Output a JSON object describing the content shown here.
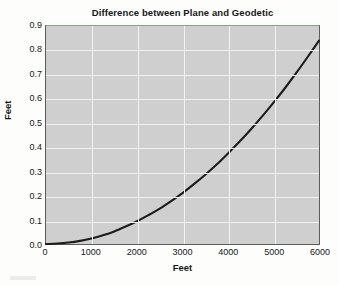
{
  "chart_data": {
    "type": "line",
    "title": "Difference between Plane and Geodetic",
    "xlabel": "Feet",
    "ylabel": "Feet",
    "xlim": [
      0,
      6000
    ],
    "ylim": [
      0.0,
      0.9
    ],
    "grid": true,
    "legend": null,
    "xticks": [
      0,
      1000,
      2000,
      3000,
      4000,
      5000,
      6000
    ],
    "xtick_labels": [
      "0",
      "1000",
      "2000",
      "3000",
      "4000",
      "5000",
      "6000"
    ],
    "yticks": [
      0.0,
      0.1,
      0.2,
      0.3,
      0.4,
      0.5,
      0.6,
      0.7,
      0.8,
      0.9
    ],
    "ytick_labels": [
      "0.0",
      "0.1",
      "0.2",
      "0.3",
      "0.4",
      "0.5",
      "0.6",
      "0.7",
      "0.8",
      "0.9"
    ],
    "series": [
      {
        "name": "Difference",
        "color": "#1c1c1c",
        "x": [
          0,
          250,
          500,
          750,
          1000,
          1250,
          1500,
          1750,
          2000,
          2250,
          2500,
          2750,
          3000,
          3250,
          3500,
          3750,
          4000,
          4250,
          4500,
          4750,
          5000,
          5250,
          5500,
          5750,
          6000
        ],
        "values": [
          0.0,
          0.002,
          0.006,
          0.013,
          0.023,
          0.036,
          0.052,
          0.072,
          0.094,
          0.119,
          0.146,
          0.177,
          0.21,
          0.247,
          0.286,
          0.328,
          0.374,
          0.422,
          0.473,
          0.527,
          0.584,
          0.643,
          0.706,
          0.772,
          0.84
        ]
      }
    ],
    "annotations": []
  },
  "figure": {
    "plot_background": "#cfcfcf",
    "page_background": "#fdfdfb",
    "gridline_color": "#f2f2f0",
    "frame_color": "#5a5d5a",
    "frame_top_color": "#7fa882",
    "text_color": "#14181a"
  }
}
